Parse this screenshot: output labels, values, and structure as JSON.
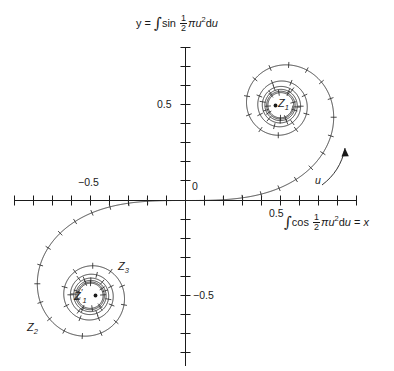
{
  "figure": {
    "background_color": "#ffffff",
    "curve_color": "#1a1a1a"
  },
  "axes": {
    "y_axis_title_prefix": "y =",
    "y_axis_title_full": "y = ∫sin ½ πu²du",
    "y_axis_integrand": "sin",
    "y_axis_tail": "πu²d",
    "y_axis_tail_var": "u",
    "x_axis_title_full": "∫cos ½ πu²du = x",
    "x_axis_integrand": "cos",
    "x_axis_tail": "πu²d",
    "x_axis_tail_var": "u",
    "x_axis_equals": "= ",
    "x_axis_result_var": "x",
    "integral_sign": "∫",
    "frac_numerator": "1",
    "frac_denominator": "2",
    "origin_label": "0",
    "x_ticks": [
      {
        "label": "−0.5",
        "value": -0.5
      },
      {
        "label": "0.5",
        "value": 0.5
      }
    ],
    "y_ticks": [
      {
        "label": "0.5",
        "value": 0.5
      },
      {
        "label": "−0.5",
        "value": -0.5
      }
    ],
    "x_range": [
      -0.9,
      0.9
    ],
    "y_range": [
      -0.8,
      0.8
    ],
    "tick_spacing": 0.1
  },
  "annotations": {
    "parameter_arrow_label": "u",
    "upper_center_label": "Z",
    "upper_center_sub": "1",
    "lower_center_label": "Z",
    "lower_center_sub": "1",
    "lower_center_prime": "′",
    "z2_label": "Z",
    "z2_sub": "2",
    "z3_label": "Z",
    "z3_sub": "3"
  },
  "chart_data": {
    "type": "line",
    "xlabel": "∫cos ½ πu²du = x",
    "ylabel": "y = ∫sin ½ πu²du",
    "grid": false,
    "legend": "none",
    "xlim": [
      -0.95,
      0.95
    ],
    "ylim": [
      -0.85,
      0.85
    ],
    "xtick_labels": [
      "−0.5",
      "0",
      "0.5"
    ],
    "ytick_labels": [
      "0.5",
      "0",
      "−0.5"
    ],
    "parametric": {
      "parameter": "u",
      "x_formula": "C(u) = ∫₀ᵘ cos(½πt²) dt",
      "y_formula": "S(u) = ∫₀ᵘ sin(½πt²) dt",
      "u_min": -5.0,
      "u_max": 5.0,
      "tick_marks_every": 0.1,
      "tick_marks_start": 0.2
    },
    "limit_points": [
      {
        "name": "Z1",
        "x": 0.5,
        "y": 0.5
      },
      {
        "name": "Z1'",
        "x": -0.5,
        "y": -0.5
      }
    ],
    "series": [
      {
        "name": "Cornu spiral",
        "x": [
          0.0,
          0.1,
          0.2,
          0.3,
          0.39974,
          0.49234,
          0.5811,
          0.66057,
          0.72284,
          0.7579,
          0.7599,
          0.72824,
          0.6658,
          0.58795,
          0.52575,
          0.48825,
          0.47369,
          0.49556,
          0.5636,
          0.65567,
          0.71353,
          0.68759,
          0.58795,
          0.47182,
          0.42894,
          0.49842,
          0.60572,
          0.63629,
          0.54999,
          0.44526,
          0.4383,
          0.53891,
          0.58156
        ],
        "y": [
          0.0,
          0.00052,
          0.00419,
          0.01412,
          0.03336,
          0.06473,
          0.11054,
          0.1721,
          0.24934,
          0.3398,
          0.43826,
          0.5365,
          0.6234,
          0.68633,
          0.71353,
          0.70368,
          0.66059,
          0.59416,
          0.51929,
          0.4555,
          0.42621,
          0.44565,
          0.49919,
          0.56563,
          0.62116,
          0.64655,
          0.63028,
          0.57497,
          0.51021,
          0.47398,
          0.4877,
          0.53693,
          0.56804
        ]
      }
    ]
  }
}
